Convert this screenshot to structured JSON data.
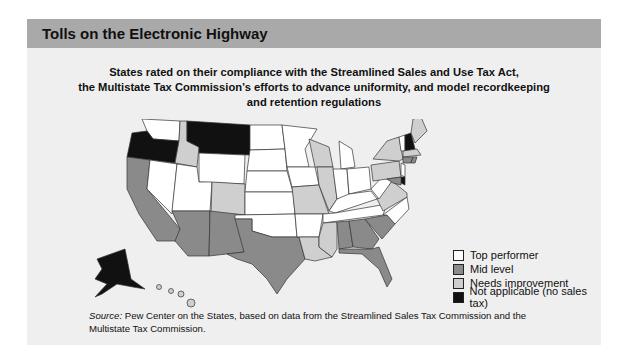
{
  "header": {
    "title": "Tolls on the Electronic Highway"
  },
  "subtitle": {
    "line1": "States rated on their compliance with the Streamlined Sales and Use Tax Act,",
    "line2": "the Multistate Tax Commission’s efforts to advance uniformity, and model recordkeeping",
    "line3": "and retention regulations"
  },
  "colors": {
    "top_performer": "#ffffff",
    "mid_level": "#8a8a8a",
    "needs_improvement": "#cfcfcf",
    "not_applicable": "#111111",
    "header_bg": "#a9a9a9",
    "panel_bg": "#efefef"
  },
  "legend": [
    {
      "key": "top_performer",
      "label": "Top performer"
    },
    {
      "key": "mid_level",
      "label": "Mid level"
    },
    {
      "key": "needs_improvement",
      "label": "Needs improvement"
    },
    {
      "key": "not_applicable",
      "label": "Not applicable (no sales tax)"
    }
  ],
  "source": {
    "label": "Source:",
    "text": " Pew Center on the States, based on data from the Streamlined Sales Tax Commission and the Multistate Tax Commission."
  },
  "map_data": {
    "top_performer": [
      "WA",
      "NV",
      "UT",
      "WY",
      "ND",
      "SD",
      "NE",
      "KS",
      "OK",
      "MN",
      "IA",
      "AR",
      "MI",
      "IN",
      "OH",
      "KY",
      "TN",
      "WV",
      "NC",
      "VT",
      "NJ"
    ],
    "mid_level": [
      "CA",
      "AZ",
      "NM",
      "TX",
      "AL",
      "GA",
      "SC",
      "FL",
      "RI",
      "CT",
      "MD"
    ],
    "needs_improvement": [
      "ID",
      "CO",
      "MO",
      "IL",
      "WI",
      "MS",
      "LA",
      "ME",
      "NY",
      "PA",
      "VA",
      "MA",
      "HI"
    ],
    "not_applicable": [
      "OR",
      "MT",
      "AK",
      "NH",
      "DE"
    ]
  }
}
